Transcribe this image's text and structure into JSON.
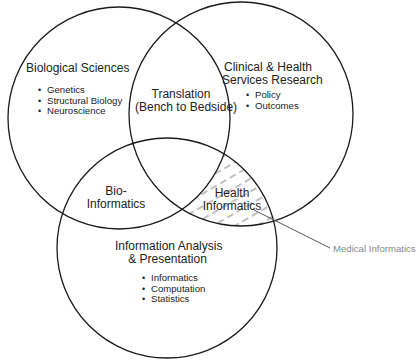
{
  "diagram": {
    "type": "venn",
    "colors": {
      "stroke": "#1a1a1a",
      "hatch": "#8c8c8c",
      "callout": "#8a8a8a",
      "text": "#222222"
    },
    "circles": [
      {
        "id": "biological-sciences",
        "title": "Biological Sciences",
        "items": [
          "Genetics",
          "Structural Biology",
          "Neuroscience"
        ]
      },
      {
        "id": "clinical-health-services",
        "title_line1": "Clinical & Health",
        "title_line2": "Services Research",
        "items": [
          "Policy",
          "Outcomes"
        ]
      },
      {
        "id": "information-analysis",
        "title_line1": "Information Analysis",
        "title_line2": "& Presentation",
        "items": [
          "Informatics",
          "Computation",
          "Statistics"
        ]
      }
    ],
    "intersections": {
      "translation": {
        "line1": "Translation",
        "line2": "(Bench to Bedside)"
      },
      "bioinformatics": {
        "line1": "Bio-",
        "line2": "Informatics"
      },
      "health_informatics": {
        "line1": "Health",
        "line2": "Informatics"
      }
    },
    "callout": {
      "label": "Medical Informatics"
    }
  }
}
